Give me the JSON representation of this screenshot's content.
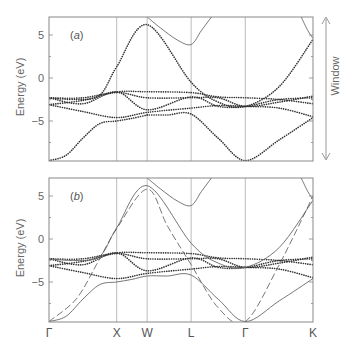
{
  "chart_data": {
    "type": "line",
    "title": "",
    "xlabel": "",
    "ylabel": "Energy (eV)",
    "ylim": [
      -9.7,
      7.1
    ],
    "yticks": [
      5,
      0,
      -5
    ],
    "kpoints": [
      "Γ",
      "X",
      "W",
      "L",
      "Γ",
      "K"
    ],
    "kpoint_positions": [
      0,
      0.2,
      0.29,
      0.42,
      0.58,
      0.78
    ],
    "window_label": "Window",
    "window_range_eV": [
      7.1,
      -9.6
    ],
    "panels": [
      {
        "label": "(a)",
        "label_text": "a",
        "series": [
          {
            "name": "Wannier-interpolated bands (dotted)",
            "style": "dotted",
            "bands": [
              {
                "x": [
                  0,
                  0.05,
                  0.1,
                  0.15,
                  0.2,
                  0.245,
                  0.29
                ],
                "y": [
                  -9.6,
                  -9.0,
                  -7.0,
                  -5.3,
                  -5.0,
                  -4.7,
                  -4.3
                ],
                "cont": [
                  0.29,
                  0.35,
                  0.42,
                  0.5,
                  0.58,
                  0.68,
                  0.78
                ],
                "cy": [
                  -4.3,
                  -4.3,
                  -4.2,
                  -7.0,
                  -9.6,
                  -7.2,
                  -4.6
                ]
              },
              {
                "x": [
                  0,
                  0.1,
                  0.2,
                  0.29,
                  0.42,
                  0.5,
                  0.58,
                  0.68,
                  0.78
                ],
                "y": [
                  -3.1,
                  -3.9,
                  -4.6,
                  -4.0,
                  -3.5,
                  -3.2,
                  -3.3,
                  -3.5,
                  -4.5
                ]
              },
              {
                "x": [
                  0,
                  0.08,
                  0.15,
                  0.2,
                  0.29,
                  0.42,
                  0.5,
                  0.58,
                  0.68,
                  0.78
                ],
                "y": [
                  -2.3,
                  -2.5,
                  -2.0,
                  1.3,
                  6.2,
                  -0.5,
                  -2.8,
                  -3.3,
                  -1.0,
                  4.5
                ]
              },
              {
                "x": [
                  0,
                  0.1,
                  0.2,
                  0.29,
                  0.42,
                  0.5,
                  0.58,
                  0.68,
                  0.78
                ],
                "y": [
                  -2.3,
                  -2.3,
                  -1.6,
                  -1.6,
                  -1.7,
                  -2.2,
                  -2.3,
                  -2.5,
                  -3.0
                ]
              },
              {
                "x": [
                  0,
                  0.1,
                  0.2,
                  0.29,
                  0.42,
                  0.5,
                  0.58,
                  0.68,
                  0.78
                ],
                "y": [
                  -3.1,
                  -2.6,
                  -1.7,
                  -2.3,
                  -2.3,
                  -2.3,
                  -3.3,
                  -2.8,
                  -2.1
                ]
              },
              {
                "x": [
                  0,
                  0.1,
                  0.2,
                  0.29,
                  0.42,
                  0.5,
                  0.58,
                  0.68,
                  0.78
                ],
                "y": [
                  -2.3,
                  -3.0,
                  -1.6,
                  -3.7,
                  -2.2,
                  -3.3,
                  -3.3,
                  -2.5,
                  -2.3
                ]
              }
            ]
          },
          {
            "name": "DFT conduction band (solid)",
            "style": "solid",
            "bands": [
              {
                "x": [
                  0.29,
                  0.33,
                  0.38,
                  0.42,
                  0.45,
                  0.48
                ],
                "y": [
                  7.1,
                  5.8,
                  4.4,
                  3.9,
                  5.5,
                  7.1
                ]
              },
              {
                "x": [
                  0.745,
                  0.765,
                  0.78
                ],
                "y": [
                  7.1,
                  5.5,
                  4.6
                ]
              }
            ]
          }
        ]
      },
      {
        "label": "(b)",
        "label_text": "b",
        "series": [
          {
            "name": "Wannier-interpolated bands (dotted)",
            "style": "dotted",
            "bands": [
              {
                "x": [
                  0,
                  0.1,
                  0.2,
                  0.29,
                  0.42,
                  0.5,
                  0.58,
                  0.68,
                  0.78
                ],
                "y": [
                  -3.1,
                  -3.9,
                  -4.6,
                  -4.0,
                  -3.5,
                  -3.2,
                  -3.3,
                  -3.5,
                  -4.5
                ]
              },
              {
                "x": [
                  0,
                  0.1,
                  0.2,
                  0.29,
                  0.42,
                  0.5,
                  0.58,
                  0.68,
                  0.78
                ],
                "y": [
                  -2.3,
                  -2.3,
                  -1.6,
                  -1.6,
                  -1.7,
                  -2.2,
                  -2.3,
                  -2.5,
                  -3.0
                ]
              },
              {
                "x": [
                  0,
                  0.1,
                  0.2,
                  0.29,
                  0.42,
                  0.5,
                  0.58,
                  0.68,
                  0.78
                ],
                "y": [
                  -3.1,
                  -2.6,
                  -1.7,
                  -2.3,
                  -2.3,
                  -2.3,
                  -3.3,
                  -2.8,
                  -2.1
                ]
              },
              {
                "x": [
                  0,
                  0.1,
                  0.2,
                  0.29,
                  0.42,
                  0.5,
                  0.58,
                  0.68,
                  0.78
                ],
                "y": [
                  -2.3,
                  -3.0,
                  -1.6,
                  -3.7,
                  -2.2,
                  -3.3,
                  -3.3,
                  -2.5,
                  -2.3
                ]
              }
            ]
          },
          {
            "name": "DFT bands (solid)",
            "style": "solid",
            "bands": [
              {
                "x": [
                  0,
                  0.05,
                  0.1,
                  0.15,
                  0.2,
                  0.245,
                  0.29,
                  0.35,
                  0.42,
                  0.5,
                  0.58,
                  0.68,
                  0.78
                ],
                "y": [
                  -9.6,
                  -9.0,
                  -7.0,
                  -5.3,
                  -5.0,
                  -4.7,
                  -4.3,
                  -4.3,
                  -4.2,
                  -7.0,
                  -9.6,
                  -7.2,
                  -4.6
                ]
              },
              {
                "x": [
                  0,
                  0.08,
                  0.15,
                  0.2,
                  0.29,
                  0.42,
                  0.5,
                  0.58,
                  0.68,
                  0.78
                ],
                "y": [
                  -2.3,
                  -2.5,
                  -2.0,
                  1.3,
                  6.2,
                  -0.5,
                  -2.8,
                  -3.3,
                  -1.0,
                  4.5
                ]
              },
              {
                "x": [
                  0.29,
                  0.33,
                  0.38,
                  0.42,
                  0.45,
                  0.48
                ],
                "y": [
                  7.1,
                  5.8,
                  4.4,
                  3.9,
                  5.5,
                  7.1
                ]
              },
              {
                "x": [
                  0.745,
                  0.765,
                  0.78
                ],
                "y": [
                  7.1,
                  5.5,
                  4.6
                ]
              }
            ]
          },
          {
            "name": "Free-electron-like band (dashed)",
            "style": "dashed",
            "bands": [
              {
                "x": [
                  0,
                  0.08,
                  0.14,
                  0.2,
                  0.29,
                  0.35,
                  0.42,
                  0.5,
                  0.58,
                  0.68,
                  0.78
                ],
                "y": [
                  -9.6,
                  -7.0,
                  -3.0,
                  1.2,
                  5.8,
                  1.5,
                  -3.0,
                  -8.0,
                  -9.6,
                  -3.0,
                  5.0
                ]
              }
            ]
          }
        ]
      }
    ]
  }
}
